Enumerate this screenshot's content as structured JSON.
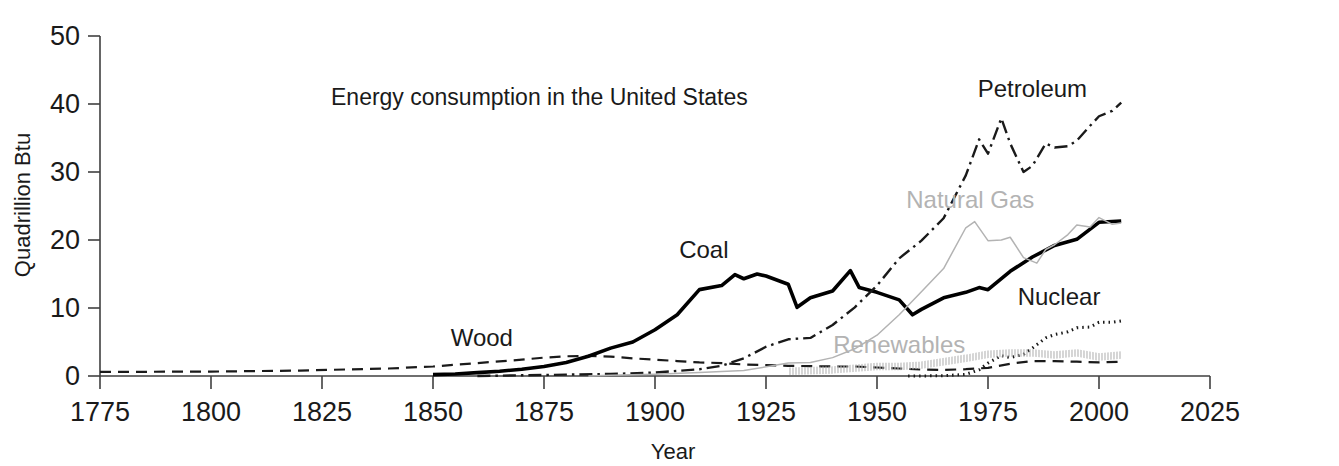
{
  "chart_data": {
    "type": "line",
    "title": "Energy consumption in the United States",
    "xlabel": "Year",
    "ylabel": "Quadrillion Btu",
    "xlim": [
      1775,
      2025
    ],
    "ylim": [
      0,
      50
    ],
    "xticks": [
      "1775",
      "1800",
      "1825",
      "1850",
      "1875",
      "1900",
      "1925",
      "1950",
      "1975",
      "2000",
      "2025"
    ],
    "yticks": [
      "0",
      "10",
      "20",
      "30",
      "40",
      "50"
    ],
    "grid": false,
    "legend_position": "inline-annotations",
    "series": [
      {
        "name": "Wood",
        "label": "Wood",
        "color": "#1a1a1a",
        "style": "dashed",
        "label_x": 1861,
        "label_y": 4.4,
        "x": [
          1775,
          1800,
          1820,
          1840,
          1850,
          1860,
          1870,
          1875,
          1880,
          1885,
          1890,
          1895,
          1900,
          1905,
          1910,
          1915,
          1920,
          1925,
          1930,
          1935,
          1940,
          1945,
          1950,
          1955,
          1960,
          1965,
          1970,
          1975,
          1980,
          1985,
          1990,
          1995,
          2000,
          2005
        ],
        "values": [
          0.6,
          0.65,
          0.8,
          1.1,
          1.4,
          1.9,
          2.4,
          2.7,
          2.9,
          2.95,
          2.85,
          2.6,
          2.4,
          2.2,
          2.0,
          1.9,
          1.7,
          1.6,
          1.5,
          1.45,
          1.4,
          1.4,
          1.25,
          1.1,
          0.95,
          0.9,
          1.0,
          1.2,
          1.8,
          2.2,
          2.2,
          2.1,
          2.0,
          2.1
        ]
      },
      {
        "name": "Coal",
        "label": "Coal",
        "color": "#000000",
        "style": "solid-thick",
        "label_x": 1911,
        "label_y": 17.3,
        "x": [
          1850,
          1855,
          1860,
          1865,
          1870,
          1875,
          1880,
          1885,
          1890,
          1895,
          1900,
          1905,
          1910,
          1915,
          1918,
          1920,
          1923,
          1925,
          1930,
          1932,
          1935,
          1940,
          1944,
          1946,
          1950,
          1955,
          1958,
          1960,
          1965,
          1970,
          1973,
          1975,
          1980,
          1985,
          1990,
          1995,
          2000,
          2005
        ],
        "values": [
          0.2,
          0.3,
          0.5,
          0.7,
          1.0,
          1.4,
          2.0,
          2.9,
          4.1,
          5.0,
          6.8,
          9.0,
          12.7,
          13.3,
          14.9,
          14.3,
          15.0,
          14.7,
          13.5,
          10.1,
          11.5,
          12.5,
          15.5,
          13.0,
          12.3,
          11.2,
          9.0,
          9.8,
          11.5,
          12.3,
          13.0,
          12.7,
          15.4,
          17.5,
          19.2,
          20.1,
          22.6,
          22.8
        ]
      },
      {
        "name": "Petroleum",
        "label": "Petroleum",
        "color": "#1a1a1a",
        "style": "dashdot",
        "label_x": 1985,
        "label_y": 41.0,
        "x": [
          1860,
          1870,
          1880,
          1890,
          1900,
          1910,
          1915,
          1920,
          1925,
          1930,
          1935,
          1940,
          1945,
          1950,
          1955,
          1960,
          1965,
          1970,
          1973,
          1975,
          1978,
          1980,
          1983,
          1985,
          1988,
          1990,
          1993,
          1995,
          1998,
          2000,
          2003,
          2005
        ],
        "values": [
          0.0,
          0.1,
          0.2,
          0.3,
          0.5,
          1.0,
          1.5,
          2.6,
          4.3,
          5.4,
          5.6,
          7.5,
          10.1,
          13.3,
          17.3,
          19.9,
          23.2,
          29.5,
          34.8,
          32.7,
          37.9,
          34.2,
          30.0,
          30.9,
          34.2,
          33.6,
          33.8,
          34.6,
          36.8,
          38.2,
          39.0,
          40.2
        ]
      },
      {
        "name": "Natural Gas",
        "label": "Natural Gas",
        "color": "#b3b3b3",
        "style": "solid-thin",
        "label_x": 1971,
        "label_y": 24.7,
        "x": [
          1885,
          1890,
          1900,
          1910,
          1920,
          1930,
          1935,
          1940,
          1945,
          1950,
          1955,
          1960,
          1965,
          1970,
          1972,
          1975,
          1978,
          1980,
          1983,
          1986,
          1988,
          1990,
          1993,
          1995,
          1998,
          2000,
          2003,
          2005
        ],
        "values": [
          0.0,
          0.1,
          0.25,
          0.5,
          0.8,
          1.9,
          2.0,
          2.7,
          4.0,
          6.0,
          9.0,
          12.4,
          15.8,
          21.8,
          22.7,
          19.9,
          20.0,
          20.4,
          17.4,
          16.6,
          18.6,
          19.3,
          20.8,
          22.2,
          21.9,
          23.3,
          22.3,
          22.5
        ]
      },
      {
        "name": "Nuclear",
        "label": "Nuclear",
        "color": "#1a1a1a",
        "style": "dotted",
        "label_x": 1991,
        "label_y": 10.4,
        "x": [
          1957,
          1960,
          1965,
          1970,
          1973,
          1975,
          1978,
          1980,
          1983,
          1985,
          1988,
          1990,
          1993,
          1995,
          1998,
          2000,
          2003,
          2005
        ],
        "values": [
          0.0,
          0.01,
          0.04,
          0.24,
          0.91,
          1.9,
          3.0,
          2.7,
          3.2,
          4.1,
          5.6,
          6.1,
          6.5,
          7.1,
          7.2,
          7.9,
          7.9,
          8.1
        ]
      },
      {
        "name": "Renewables",
        "label": "Renewables",
        "color": "#b3b3b3",
        "style": "hatched",
        "label_x": 1955,
        "label_y": 3.4,
        "x": [
          1930,
          1940,
          1950,
          1955,
          1960,
          1965,
          1970,
          1975,
          1980,
          1985,
          1990,
          1995,
          2000,
          2005
        ],
        "values": [
          0.7,
          0.9,
          1.4,
          1.4,
          1.6,
          2.1,
          2.6,
          3.2,
          3.4,
          3.4,
          3.1,
          3.4,
          2.8,
          3.1
        ]
      }
    ]
  }
}
